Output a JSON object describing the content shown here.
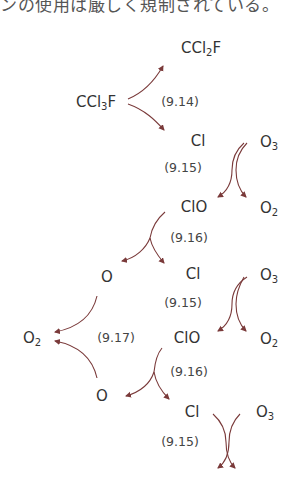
{
  "header_text": "ンの使用は厳しく規制されている。",
  "arrow_color": "#7a3a3a",
  "species": {
    "ccl2f": {
      "base": "CCl",
      "sub": "2",
      "tail": "F"
    },
    "ccl3f": {
      "base": "CCl",
      "sub": "3",
      "tail": "F"
    },
    "cl_1": "Cl",
    "o3_1": {
      "base": "O",
      "sub": "3"
    },
    "clo_1": "ClO",
    "o2_1": {
      "base": "O",
      "sub": "2"
    },
    "o_1": "O",
    "cl_2": "Cl",
    "o3_2": {
      "base": "O",
      "sub": "3"
    },
    "o2_left": {
      "base": "O",
      "sub": "2"
    },
    "clo_2": "ClO",
    "o2_2": {
      "base": "O",
      "sub": "2"
    },
    "o_2": "O",
    "cl_3": "Cl",
    "o3_3": {
      "base": "O",
      "sub": "3"
    }
  },
  "equations": {
    "eq_9_14": "(9.14)",
    "eq_9_15_a": "(9.15)",
    "eq_9_16_a": "(9.16)",
    "eq_9_15_b": "(9.15)",
    "eq_9_17": "(9.17)",
    "eq_9_16_b": "(9.16)",
    "eq_9_15_c": "(9.15)"
  }
}
